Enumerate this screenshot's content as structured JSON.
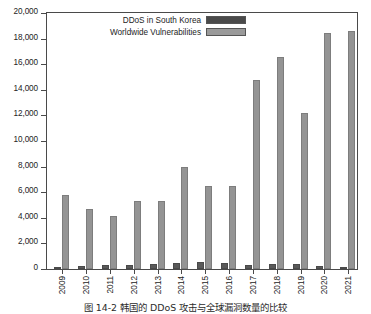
{
  "chart_data": {
    "type": "bar",
    "title": "",
    "xlabel": "",
    "ylabel": "",
    "ylim": [
      0,
      20000
    ],
    "ytick_step": 2000,
    "ytick_labels": [
      "0",
      "2,000",
      "4,000",
      "6,000",
      "8,000",
      "10,000",
      "12,000",
      "14,000",
      "16,000",
      "18,000",
      "20,000"
    ],
    "ytick_values": [
      0,
      2000,
      4000,
      6000,
      8000,
      10000,
      12000,
      14000,
      16000,
      18000,
      20000
    ],
    "grid": false,
    "legend_position": "top-center",
    "categories": [
      "2009",
      "2010",
      "2011",
      "2012",
      "2013",
      "2014",
      "2015",
      "2016",
      "2017",
      "2018",
      "2019",
      "2020",
      "2021"
    ],
    "series": [
      {
        "name": "DDoS in South Korea",
        "color": "#595959",
        "values": [
          60,
          230,
          310,
          300,
          390,
          470,
          530,
          480,
          340,
          370,
          400,
          250,
          40
        ]
      },
      {
        "name": "Worldwide Vulnerabilities",
        "color": "#949494",
        "values": [
          5750,
          4650,
          4150,
          5300,
          5300,
          8000,
          6500,
          6450,
          14750,
          16600,
          12200,
          18400,
          18600
        ]
      }
    ]
  },
  "legend": {
    "items": [
      {
        "label": "DDoS in South Korea",
        "swatch": "dark"
      },
      {
        "label": "Worldwide Vulnerabilities",
        "swatch": "light"
      }
    ]
  },
  "caption": {
    "text": "图 14-2   韩国的 DDoS 攻击与全球漏洞数量的比较"
  }
}
